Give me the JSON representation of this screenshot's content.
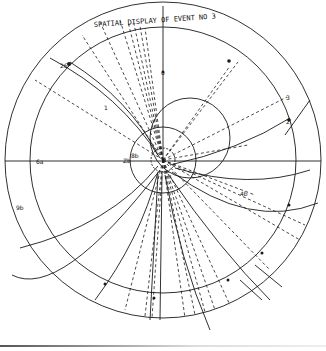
{
  "diagram": {
    "title": "SPATIAL DISPLAY OF EVENT NO 3",
    "labels": {
      "top_axis": "0",
      "left_axis": "6a",
      "center_left": "Zb",
      "center_small": "8b",
      "upper_right_mark": "3",
      "right_mark": "2",
      "lower_right_mark": "4b",
      "left_lower_mark": "9b",
      "upper_left_mark": "26",
      "track_label_upper": "1"
    },
    "colors": {
      "ink": "#1a1a1a",
      "paper": "#ffffff"
    }
  }
}
